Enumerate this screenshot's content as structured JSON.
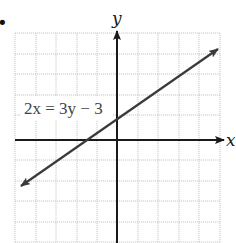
{
  "figure": {
    "bullet": "•",
    "equation_label": "2x = 3y − 3",
    "axes": {
      "x_label": "x",
      "y_label": "y"
    },
    "grid": {
      "x_min": -5,
      "x_max": 5,
      "y_min": -5,
      "y_max": 5,
      "unit_px": 20.5,
      "origin_px": [
        117,
        140
      ],
      "grid_color": "#c8c8c8",
      "axis_color": "#1a1a1a",
      "line_color": "#3a3a3a"
    },
    "line": {
      "equation": "2x = 3y - 3",
      "slope": 0.6667,
      "y_intercept": 1,
      "x_intercept": -1.5,
      "from": [
        -4.8,
        -2.2
      ],
      "to": [
        5,
        4.33
      ],
      "arrows": "both"
    }
  }
}
